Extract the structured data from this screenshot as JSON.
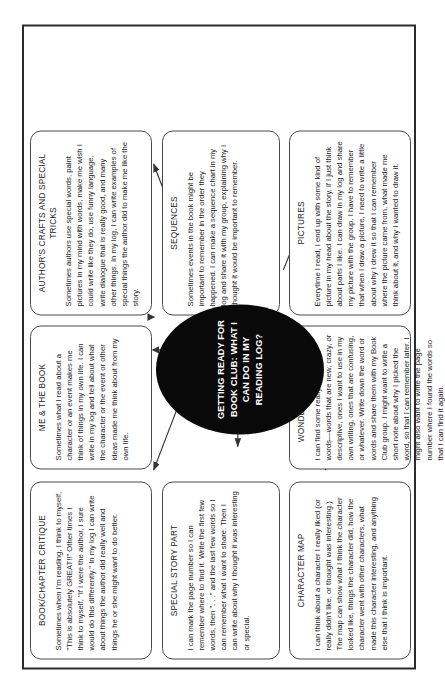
{
  "diagram": {
    "center": {
      "label": "GETTING READY FOR BOOK CLUB: WHAT I CAN DO IN MY READING LOG?",
      "shape": "oval",
      "fill_color": "#090909",
      "text_color": "#ffffff"
    },
    "frame_color": "#2b2b2b",
    "node_border_color": "#4a4a4a",
    "nodes": [
      {
        "id": "book-chapter-critique",
        "heading": "BOOK/CHAPTER CRITIQUE",
        "body": "Sometimes when I'm reading, I think to myself, \"This is absolutely GREAT!!\" Other times I think to myself, \"If I were the author, I sure would do this differently.\" In my log I can write about things the author did really well and things he or she might want to do better."
      },
      {
        "id": "me-and-the-book",
        "heading": "ME & THE BOOK",
        "body": "Sometimes what I read about a character or an event makes me think of things in my own life. I can write in my log and tell about what the character or the event or other ideas made me think about from my own life."
      },
      {
        "id": "authors-crafts",
        "heading": "AUTHOR'S CRAFTS AND SPECIAL TRICKS",
        "body": "Sometimes authors use special words, paint pictures in my mind with words, make me wish I could write like they do, use funny language, write dialogue that is really good, and many other things. In my log, I can write examples of special things the author did to make me like the story."
      },
      {
        "id": "special-story-part",
        "heading": "SPECIAL STORY PART",
        "body": "I can mark the page number so I can remember where to find it. Write the first few words, then \". . .\" and the last few words so I can remember what I want to share. Then I can write about why I thought it was interesting or special."
      },
      {
        "id": "sequences",
        "heading": "SEQUENCES",
        "body": "Sometimes events in the book might be important to remember in the order they happened. I can make a sequence chart in my log and share it with my group, explaining why I thought it would be important to remember."
      },
      {
        "id": "character-map",
        "heading": "CHARACTER MAP",
        "body": "I can think about a character I really liked (or really didn't like, or thought was interesting.) The map can show what I think the character looked like, things the character did, how the character went with other characters, what made this character interesting, and anything else that I think is important."
      },
      {
        "id": "wonderful-words",
        "heading": "WONDERFUL WORDS",
        "body": "I can find some really wonderful words—words that are new, crazy, or descriptive, ones I want to use in my own writing, ones that are confusing, or whatever. Write down the word or words and share them with my Book Club group. I might want to write a short note about why I picked the word, so that I can remember later. I might also want to write the page number where I found the words so that I can find it again."
      },
      {
        "id": "pictures",
        "heading": "PICTURES",
        "body": "Everytime I read, I end up with some kind of picture in my head about the story, if I just think about parts I like. I can draw in my log and share my picture with the group. I have to remember that when I draw a picture, I need to write a little about why I drew it so that I can remember where the picture came from, what made me think about it, and why I wanted to draw it."
      }
    ]
  }
}
